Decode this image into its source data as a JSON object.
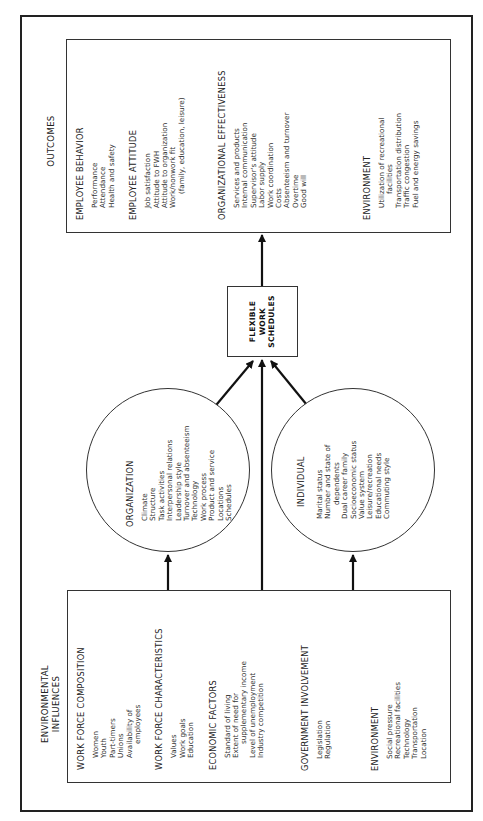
{
  "diagram": {
    "orientation": "rotated-90-ccw",
    "colors": {
      "line": "#222222",
      "text": "#222222",
      "background": "#ffffff"
    },
    "outcomes": {
      "title": "OUTCOMES",
      "sections": [
        {
          "heading": "EMPLOYEE BEHAVIOR",
          "items": [
            "Performance",
            "Attendance",
            "Health and safety"
          ]
        },
        {
          "heading": "EMPLOYEE ATTITUDE",
          "items": [
            "Job satisfaction",
            "Attitude to FWH",
            "Attitude to organization",
            "Work/nonwork fit",
            "(family, education, leisure)"
          ]
        },
        {
          "heading": "ORGANIZATIONAL EFFECTIVENESS",
          "items": [
            "Services and products",
            "Internal communication",
            "Supervisor's attitude",
            "Labor supply",
            "Work coordination",
            "Costs",
            "Absenteeism and turnover",
            "Overtime",
            "Good will"
          ]
        },
        {
          "heading": "ENVIRONMENT",
          "items": [
            "Utilization of recreational",
            "facilities",
            "Transportation distribution",
            "Traffic congestion",
            "Fuel and energy savings"
          ]
        }
      ]
    },
    "center": {
      "line1": "FLEXIBLE",
      "line2": "WORK",
      "line3": "SCHEDULES"
    },
    "organization": {
      "title": "ORGANIZATION",
      "items": [
        "Climate",
        "Structure",
        "Task activities",
        "Interpersonal relations",
        "Leadership style",
        "Turnover and absenteeism",
        "Technology",
        "Work process",
        "Product and service",
        "Locations",
        "Schedules"
      ]
    },
    "individual": {
      "title": "INDIVIDUAL",
      "items": [
        "Marital status",
        "Number and state of",
        "dependents",
        "Dual career family",
        "Socioeconomic status",
        "Value system",
        "Leisure/recreation",
        "Educational needs",
        "Commuting style"
      ]
    },
    "environmental": {
      "title_line1": "ENVIRONMENTAL",
      "title_line2": "INFLUENCES",
      "sections": [
        {
          "heading": "WORK FORCE COMPOSITION",
          "items": [
            "Women",
            "Youth",
            "Part-timers",
            "Unions",
            "Availability of",
            "employees"
          ]
        },
        {
          "heading": "WORK FORCE CHARACTERISTICS",
          "items": [
            "Values",
            "Work goals",
            "Education"
          ]
        },
        {
          "heading": "ECONOMIC FACTORS",
          "items": [
            "Standard of living",
            "Extent of need for",
            "supplementary income",
            "Level of unemployment",
            "Industry competition"
          ]
        },
        {
          "heading": "GOVERNMENT INVOLVEMENT",
          "items": [
            "Legislation",
            "Regulation"
          ]
        },
        {
          "heading": "ENVIRONMENT",
          "items": [
            "Social pressure",
            "Recreational facilities",
            "Technology",
            "Transportation",
            "Location"
          ]
        }
      ]
    }
  }
}
